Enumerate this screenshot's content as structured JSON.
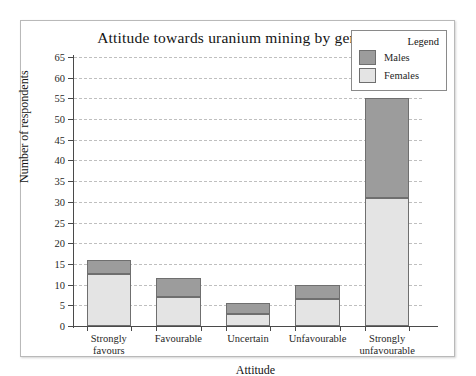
{
  "figure": {
    "title": "Attitude towards uranium mining by gender"
  },
  "legend": {
    "title": "Legend",
    "entries": [
      {
        "label": "Males",
        "color": "#9c9c9c"
      },
      {
        "label": "Females",
        "color": "#e4e4e4"
      }
    ]
  },
  "chart_data": {
    "type": "bar",
    "stacked": true,
    "title": "Attitude towards uranium mining by gender",
    "xlabel": "Attitude",
    "ylabel": "Number of respondents",
    "categories": [
      "Strongly favours",
      "Favourable",
      "Uncertain",
      "Unfavourable",
      "Strongly unfavourable"
    ],
    "series": [
      {
        "name": "Females",
        "color": "#e4e4e4",
        "values": [
          12.5,
          7,
          3,
          6.5,
          31
        ]
      },
      {
        "name": "Males",
        "color": "#9c9c9c",
        "values": [
          3.5,
          4.5,
          2.5,
          3.5,
          24
        ]
      }
    ],
    "totals": [
      16,
      11.5,
      5.5,
      10,
      55
    ],
    "ylim": [
      0,
      65
    ],
    "ytick_step": 5,
    "yticks": [
      0,
      5,
      10,
      15,
      20,
      25,
      30,
      35,
      40,
      45,
      50,
      55,
      60,
      65
    ],
    "ytick_labels": [
      "0",
      "5",
      "10",
      "15",
      "20",
      "25",
      "30",
      "35",
      "40",
      "45",
      "50",
      "55",
      "60",
      "65"
    ],
    "grid": true,
    "grid_style": "dashed",
    "grid_color": "#bfbfbf",
    "legend_position": "top-right"
  }
}
